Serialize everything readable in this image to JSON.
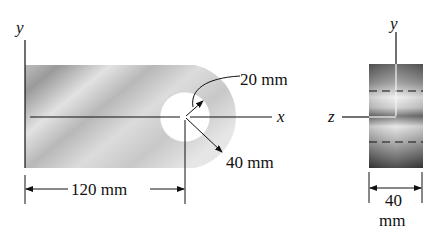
{
  "diagram": {
    "side_view": {
      "axis_labels": {
        "y": "y",
        "x": "x"
      },
      "dimensions": {
        "inner_radius": "20 mm",
        "outer_radius": "40 mm",
        "length": "120 mm"
      }
    },
    "end_view": {
      "axis_labels": {
        "y": "y",
        "z": "z"
      },
      "dimensions": {
        "thickness_value": "40",
        "thickness_unit": "mm"
      }
    }
  }
}
